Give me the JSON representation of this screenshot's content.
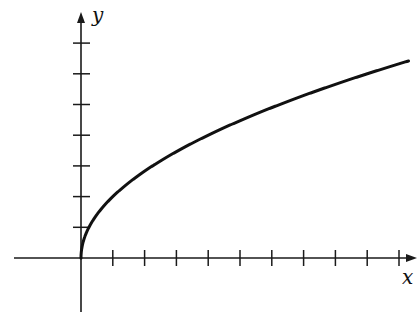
{
  "figure": {
    "function": "y = 2√x",
    "x_axis_label": "x",
    "y_axis_label": "y",
    "colors": {
      "axis": "#1a1a1a",
      "curve": "#111111",
      "background": "#ffffff"
    }
  },
  "chart_data": {
    "type": "line",
    "title": "",
    "xlabel": "x",
    "ylabel": "y",
    "x_ticks": [
      1,
      2,
      3,
      4,
      5,
      6,
      7,
      8,
      9,
      10
    ],
    "y_ticks": [
      1,
      2,
      3,
      4,
      5,
      6,
      7
    ],
    "tick_labels_shown": false,
    "grid": false,
    "series": [
      {
        "name": "y = 2√x",
        "x": [
          0,
          0.25,
          1,
          2,
          3,
          4,
          5,
          6,
          7,
          8,
          9,
          10,
          10.3
        ],
        "values": [
          0,
          1,
          2,
          2.83,
          3.46,
          4,
          4.47,
          4.9,
          5.29,
          5.66,
          6,
          6.32,
          6.42
        ]
      }
    ],
    "xlim": [
      -2,
      10.5
    ],
    "ylim": [
      -1.8,
      7.5
    ]
  }
}
